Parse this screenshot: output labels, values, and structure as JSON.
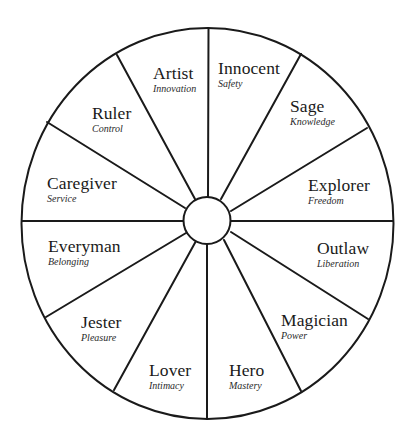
{
  "diagram": {
    "type": "archetype-wheel",
    "line_color": "#1a1a1a",
    "background": "#ffffff",
    "segment_count": 12,
    "segments": [
      {
        "name": "Innocent",
        "trait": "Safety",
        "x": 218,
        "y": 60
      },
      {
        "name": "Sage",
        "trait": "Knowledge",
        "x": 290,
        "y": 98
      },
      {
        "name": "Explorer",
        "trait": "Freedom",
        "x": 308,
        "y": 177
      },
      {
        "name": "Outlaw",
        "trait": "Liberation",
        "x": 317,
        "y": 240
      },
      {
        "name": "Magician",
        "trait": "Power",
        "x": 281,
        "y": 312
      },
      {
        "name": "Hero",
        "trait": "Mastery",
        "x": 229,
        "y": 362
      },
      {
        "name": "Lover",
        "trait": "Intimacy",
        "x": 149,
        "y": 362
      },
      {
        "name": "Jester",
        "trait": "Pleasure",
        "x": 81,
        "y": 314
      },
      {
        "name": "Everyman",
        "trait": "Belonging",
        "x": 48,
        "y": 238
      },
      {
        "name": "Caregiver",
        "trait": "Service",
        "x": 47,
        "y": 175
      },
      {
        "name": "Ruler",
        "trait": "Control",
        "x": 92,
        "y": 105
      },
      {
        "name": "Artist",
        "trait": "Innovation",
        "x": 153,
        "y": 65
      }
    ]
  }
}
